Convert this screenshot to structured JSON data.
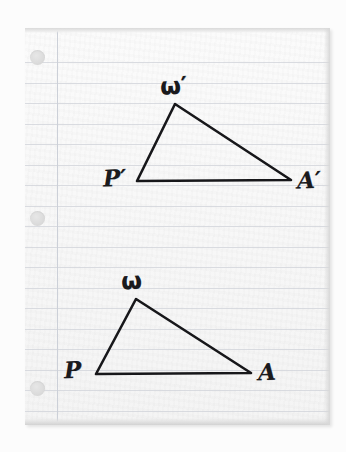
{
  "scene": {
    "subject": "hand-drawn geometry figure on ruled notebook paper",
    "background_color": "#fcfcfc"
  },
  "paper": {
    "color": "#fafafa",
    "rule_color": "#d3d6dc",
    "rule_count": 18,
    "rule_spacing_px": 20.5,
    "first_rule_y_px": 34,
    "margin_rule_color": "#ccd0d8",
    "margin_rule_x_px": 32,
    "holes": [
      {
        "name": "hole-top",
        "cx": 12,
        "cy": 29
      },
      {
        "name": "hole-middle",
        "cx": 12,
        "cy": 190
      },
      {
        "name": "hole-bottom",
        "cx": 12,
        "cy": 360
      }
    ]
  },
  "ink": {
    "color": "#17171a",
    "stroke_width": 2.6
  },
  "figures": [
    {
      "id": "image-triangle",
      "name": "triangle-omega-prime-p-prime-a-prime",
      "vertices": [
        {
          "label": "ω′",
          "name": "vertex-omega-prime",
          "x": 175,
          "y": 104,
          "label_x": 160,
          "label_y": 74
        },
        {
          "label": "P′",
          "name": "vertex-p-prime",
          "x": 137,
          "y": 181,
          "label_x": 103,
          "label_y": 166
        },
        {
          "label": "A′",
          "name": "vertex-a-prime",
          "x": 291,
          "y": 180,
          "label_x": 297,
          "label_y": 168
        }
      ]
    },
    {
      "id": "preimage-triangle",
      "name": "triangle-omega-p-a",
      "vertices": [
        {
          "label": "ω",
          "name": "vertex-omega",
          "x": 136,
          "y": 299,
          "label_x": 121,
          "label_y": 269
        },
        {
          "label": "P",
          "name": "vertex-p",
          "x": 96,
          "y": 374,
          "label_x": 64,
          "label_y": 358
        },
        {
          "label": "A",
          "name": "vertex-a",
          "x": 251,
          "y": 373,
          "label_x": 258,
          "label_y": 360
        }
      ]
    }
  ]
}
